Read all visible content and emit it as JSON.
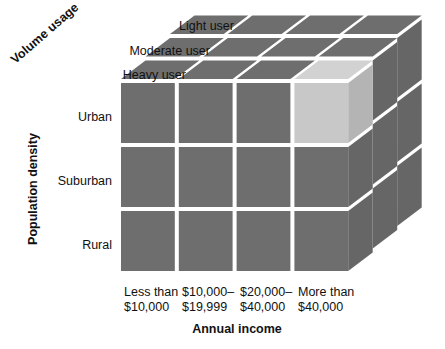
{
  "figure": {
    "type": "three-dimensional-segmentation-cube",
    "axes": {
      "depth": {
        "title": "Volume usage",
        "labels": [
          "Heavy user",
          "Moderate user",
          "Light user"
        ]
      },
      "vertical": {
        "title": "Population density",
        "labels": [
          "Urban",
          "Suburban",
          "Rural"
        ]
      },
      "horizontal": {
        "title": "Annual income",
        "labels": [
          "Less than\n$10,000",
          "$10,000–\n$19,999",
          "$20,000–\n$40,000",
          "More than\n$40,000"
        ],
        "labels_line1": [
          "Less than",
          "$10,000–",
          "$20,000–",
          "More than"
        ],
        "labels_line2": [
          "$10,000",
          "$19,999",
          "$40,000",
          "$40,000"
        ]
      }
    },
    "highlighted_cell": {
      "annual_income": "More than $40,000",
      "population_density": "Urban",
      "volume_usage": "Heavy user"
    },
    "colors": {
      "cell_fill": "#6e6e6e",
      "cell_top_fill": "#6e6e6e",
      "cell_side_fill": "#666666",
      "highlight_front": "#c8c8c8",
      "highlight_top": "#d2d2d2",
      "highlight_side": "#b4b4b4",
      "grid_line": "#ffffff",
      "text": "#111111",
      "background": "#ffffff"
    },
    "grid": {
      "columns": 4,
      "rows": 3,
      "depth": 3
    }
  }
}
